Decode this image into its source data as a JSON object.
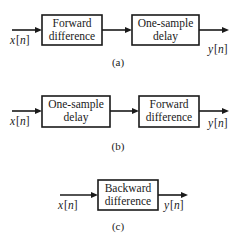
{
  "diagrams": [
    {
      "caption": "(a)",
      "input": {
        "var": "x",
        "open": "[",
        "idx": "n",
        "close": "]"
      },
      "output": {
        "var": "y",
        "open": "[",
        "idx": "n",
        "close": "]"
      },
      "blocks": [
        {
          "line1": "Forward",
          "line2": "difference"
        },
        {
          "line1": "One-sample",
          "line2": "delay"
        }
      ]
    },
    {
      "caption": "(b)",
      "input": {
        "var": "x",
        "open": "[",
        "idx": "n",
        "close": "]"
      },
      "output": {
        "var": "y",
        "open": "[",
        "idx": "n",
        "close": "]"
      },
      "blocks": [
        {
          "line1": "One-sample",
          "line2": "delay"
        },
        {
          "line1": "Forward",
          "line2": "difference"
        }
      ]
    },
    {
      "caption": "(c)",
      "input": {
        "var": "x",
        "open": "[",
        "idx": "n",
        "close": "]"
      },
      "output": {
        "var": "y",
        "open": "[",
        "idx": "n",
        "close": "]"
      },
      "blocks": [
        {
          "line1": "Backward",
          "line2": "difference"
        }
      ]
    }
  ]
}
